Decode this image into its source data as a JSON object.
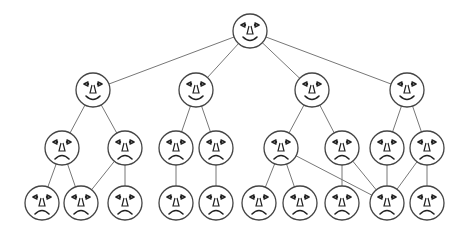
{
  "diagram": {
    "title": "",
    "type": "tree of faces",
    "colors": {
      "line": "#777777",
      "outline": "#444444",
      "feature": "#222222",
      "background": "#ffffff"
    },
    "face_radius": 17,
    "nodes": [
      {
        "id": "r",
        "level": 0,
        "x": 250,
        "y": 31,
        "mood": "happy"
      },
      {
        "id": "a",
        "level": 1,
        "x": 93,
        "y": 90,
        "mood": "happy"
      },
      {
        "id": "b",
        "level": 1,
        "x": 196,
        "y": 90,
        "mood": "happy"
      },
      {
        "id": "c",
        "level": 1,
        "x": 312,
        "y": 90,
        "mood": "happy"
      },
      {
        "id": "d",
        "level": 1,
        "x": 407,
        "y": 90,
        "mood": "happy"
      },
      {
        "id": "a1",
        "level": 2,
        "x": 62,
        "y": 148,
        "mood": "sad"
      },
      {
        "id": "a2",
        "level": 2,
        "x": 125,
        "y": 148,
        "mood": "sad"
      },
      {
        "id": "b1",
        "level": 2,
        "x": 176,
        "y": 148,
        "mood": "sad"
      },
      {
        "id": "b2",
        "level": 2,
        "x": 216,
        "y": 148,
        "mood": "sad"
      },
      {
        "id": "c1",
        "level": 2,
        "x": 281,
        "y": 148,
        "mood": "sad"
      },
      {
        "id": "c2",
        "level": 2,
        "x": 342,
        "y": 148,
        "mood": "sad"
      },
      {
        "id": "d1",
        "level": 2,
        "x": 387,
        "y": 148,
        "mood": "sad"
      },
      {
        "id": "d2",
        "level": 2,
        "x": 427,
        "y": 148,
        "mood": "sad"
      },
      {
        "id": "a1x",
        "level": 3,
        "x": 42,
        "y": 203,
        "mood": "sad"
      },
      {
        "id": "a1y",
        "level": 3,
        "x": 81,
        "y": 203,
        "mood": "sad"
      },
      {
        "id": "a2x",
        "level": 3,
        "x": 125,
        "y": 203,
        "mood": "sad"
      },
      {
        "id": "b1x",
        "level": 3,
        "x": 176,
        "y": 203,
        "mood": "sad"
      },
      {
        "id": "b2x",
        "level": 3,
        "x": 216,
        "y": 203,
        "mood": "sad"
      },
      {
        "id": "c1x",
        "level": 3,
        "x": 259,
        "y": 203,
        "mood": "sad"
      },
      {
        "id": "c1y",
        "level": 3,
        "x": 300,
        "y": 203,
        "mood": "sad"
      },
      {
        "id": "c2x",
        "level": 3,
        "x": 342,
        "y": 203,
        "mood": "sad"
      },
      {
        "id": "d1x",
        "level": 3,
        "x": 387,
        "y": 203,
        "mood": "sad"
      },
      {
        "id": "d2x",
        "level": 3,
        "x": 427,
        "y": 203,
        "mood": "sad"
      }
    ],
    "edges": [
      [
        "r",
        "a"
      ],
      [
        "r",
        "b"
      ],
      [
        "r",
        "c"
      ],
      [
        "r",
        "d"
      ],
      [
        "a",
        "a1"
      ],
      [
        "a",
        "a2"
      ],
      [
        "b",
        "b1"
      ],
      [
        "b",
        "b2"
      ],
      [
        "c",
        "c1"
      ],
      [
        "c",
        "c2"
      ],
      [
        "d",
        "d1"
      ],
      [
        "d",
        "d2"
      ],
      [
        "a1",
        "a1x"
      ],
      [
        "a1",
        "a1y"
      ],
      [
        "a2",
        "a1y"
      ],
      [
        "a2",
        "a2x"
      ],
      [
        "b1",
        "b1x"
      ],
      [
        "b2",
        "b2x"
      ],
      [
        "c1",
        "c1x"
      ],
      [
        "c1",
        "c1y"
      ],
      [
        "c1",
        "d1x"
      ],
      [
        "c2",
        "c2x"
      ],
      [
        "c2",
        "d1x"
      ],
      [
        "d1",
        "d1x"
      ],
      [
        "d2",
        "d1x"
      ],
      [
        "d2",
        "d2x"
      ]
    ]
  }
}
